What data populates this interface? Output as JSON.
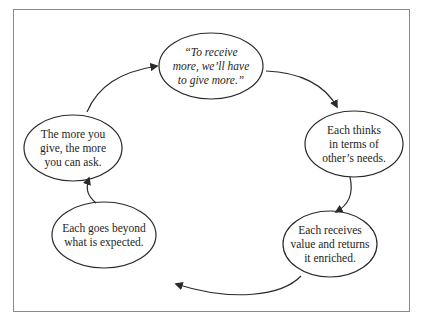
{
  "diagram": {
    "type": "cycle",
    "nodes": [
      {
        "id": "n1",
        "text": "“To receive\nmore, we’ll have\nto give more.”",
        "italic": true
      },
      {
        "id": "n2",
        "text": "Each thinks\nin terms of\nother’s needs."
      },
      {
        "id": "n3",
        "text": "Each receives\nvalue and returns\nit enriched."
      },
      {
        "id": "n4",
        "text": "Each goes beyond\nwhat is expected."
      },
      {
        "id": "n5",
        "text": "The more you\ngive, the more\nyou can ask."
      }
    ],
    "edges": [
      {
        "from": "n1",
        "to": "n2"
      },
      {
        "from": "n2",
        "to": "n3"
      },
      {
        "from": "n3",
        "to": "n4"
      },
      {
        "from": "n4",
        "to": "n5"
      },
      {
        "from": "n5",
        "to": "n1"
      }
    ],
    "colors": {
      "stroke": "#2a2a2a",
      "frame": "#8a8a8a",
      "background": "#ffffff"
    }
  }
}
